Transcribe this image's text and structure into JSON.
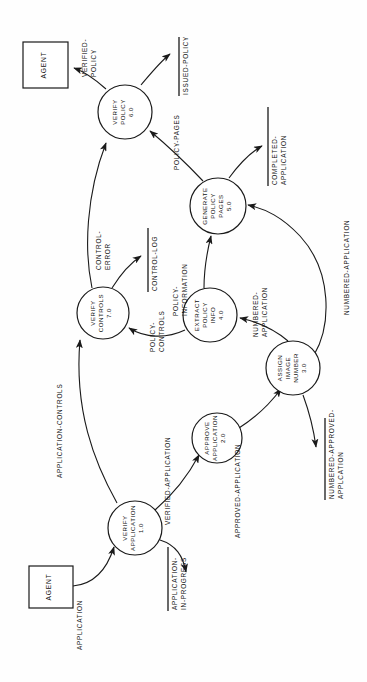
{
  "diagram": {
    "orientation_degrees": 90,
    "colors": {
      "ink": "#1a1a1a",
      "paper": "#ffffff"
    },
    "external_entities": [
      {
        "id": "agent-top",
        "label": "AGENT"
      },
      {
        "id": "agent-bottom",
        "label": "AGENT"
      }
    ],
    "processes": [
      {
        "id": "p1",
        "line1": "VERIFY",
        "line2": "APPLICATION",
        "number": "1.0"
      },
      {
        "id": "p2",
        "line1": "APPROVE",
        "line2": "APPLICATION",
        "number": "2.0"
      },
      {
        "id": "p3",
        "line1": "ASSIGN",
        "line2": "IMAGE",
        "line3": "NUMBER",
        "number": "3.0"
      },
      {
        "id": "p4",
        "line1": "EXTRACT",
        "line2": "POLICY",
        "line3": "INFO",
        "number": "4.0"
      },
      {
        "id": "p5",
        "line1": "GENERATE",
        "line2": "POLICY",
        "line3": "PAGES",
        "number": "5.0"
      },
      {
        "id": "p6",
        "line1": "VERIFY",
        "line2": "POLICY",
        "number": "6.0"
      },
      {
        "id": "p7",
        "line1": "VERIFY",
        "line2": "CONTROLS",
        "number": "7.0"
      }
    ],
    "data_stores": [
      {
        "id": "ds-issued-policy",
        "line1": "ISSUED-POLICY"
      },
      {
        "id": "ds-completed-app",
        "line1": "COMPLETED-",
        "line2": "APPLICATION"
      },
      {
        "id": "ds-control-log",
        "line1": "CONTROL-LOG"
      },
      {
        "id": "ds-app-in-progress",
        "line1": "APPLICATION-",
        "line2": "IN-PROGRESS"
      },
      {
        "id": "ds-numbered-approved",
        "line1": "NUMBERED-APPROVED-",
        "line2": "APPLCATION"
      }
    ],
    "data_flows": [
      {
        "id": "f-application",
        "line1": "APPLICATION"
      },
      {
        "id": "f-verified-application",
        "line1": "VERIFIED-APPLICATION"
      },
      {
        "id": "f-approved-application",
        "line1": "APPROVED-APPLICATION"
      },
      {
        "id": "f-numbered-application-a",
        "line1": "NUMBERED-",
        "line2": "APPLICATION"
      },
      {
        "id": "f-numbered-application-b",
        "line1": "NUMBERED-APPLICATION"
      },
      {
        "id": "f-policy-information",
        "line1": "POLICY-",
        "line2": "INFORMATION"
      },
      {
        "id": "f-policy-controls",
        "line1": "POLICY-",
        "line2": "CONTROLS"
      },
      {
        "id": "f-policy-pages",
        "line1": "POLICY-PAGES"
      },
      {
        "id": "f-application-controls",
        "line1": "APPLICATION-CONTROLS"
      },
      {
        "id": "f-control-error",
        "line1": "CONTROL-",
        "line2": "ERROR"
      },
      {
        "id": "f-verified-policy",
        "line1": "VERIFIED-",
        "line2": "POLICY"
      }
    ]
  }
}
